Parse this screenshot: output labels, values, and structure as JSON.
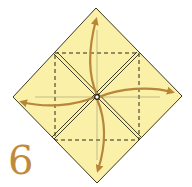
{
  "diagram": {
    "step_number": "6",
    "paper_color": "#fbf0a8",
    "line_color": "#2a2a1a",
    "arrow_color": "#b8863a",
    "step_color": "#c08a3c",
    "elements": [
      "diamond-outline",
      "dashed-inner-square",
      "double-diagonal-creases",
      "center-dot",
      "arrow-up",
      "arrow-right",
      "arrow-down",
      "arrow-left"
    ]
  }
}
